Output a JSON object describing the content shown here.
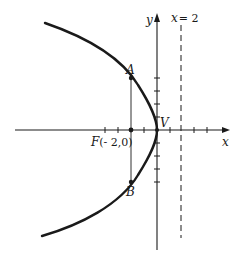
{
  "figure": {
    "type": "parabola diagram",
    "equation_implied": "y^2 = -8x",
    "labels": {
      "y_axis": "y",
      "x_axis": "x",
      "directrix": "x = 2",
      "directrix_prefix": "x",
      "directrix_value": "= 2",
      "point_a": "A",
      "point_b": "B",
      "vertex": "V",
      "focus": "F(- 2,0)",
      "focus_letter": "F",
      "focus_coords": "(- 2,0)"
    },
    "colors": {
      "curve": "#1a1a1a",
      "axes": "#1a1a1a",
      "background": "#ffffff"
    }
  }
}
